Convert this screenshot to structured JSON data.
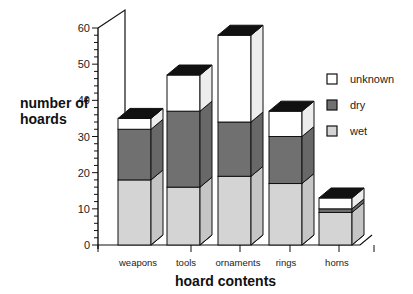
{
  "chart_data": {
    "type": "bar",
    "stacked": true,
    "style": "3d",
    "title": "",
    "xlabel": "hoard contents",
    "ylabel": "number of hoards",
    "ylim": [
      0,
      60
    ],
    "yticks": [
      0,
      10,
      20,
      30,
      40,
      50,
      60
    ],
    "grid": false,
    "legend_position": "right",
    "categories": [
      "weapons",
      "tools",
      "ornaments",
      "rings",
      "horns"
    ],
    "series": [
      {
        "name": "wet",
        "color": "#d4d4d4",
        "values": [
          18,
          16,
          19,
          17,
          9
        ]
      },
      {
        "name": "dry",
        "color": "#707070",
        "values": [
          14,
          21,
          15,
          13,
          1
        ]
      },
      {
        "name": "unknown",
        "color": "#ffffff",
        "values": [
          3,
          10,
          24,
          7,
          3
        ]
      }
    ],
    "totals": [
      35,
      47,
      58,
      37,
      13
    ]
  },
  "legend": [
    {
      "label": "unknown",
      "color": "#ffffff"
    },
    {
      "label": "dry",
      "color": "#707070"
    },
    {
      "label": "wet",
      "color": "#d4d4d4"
    }
  ]
}
